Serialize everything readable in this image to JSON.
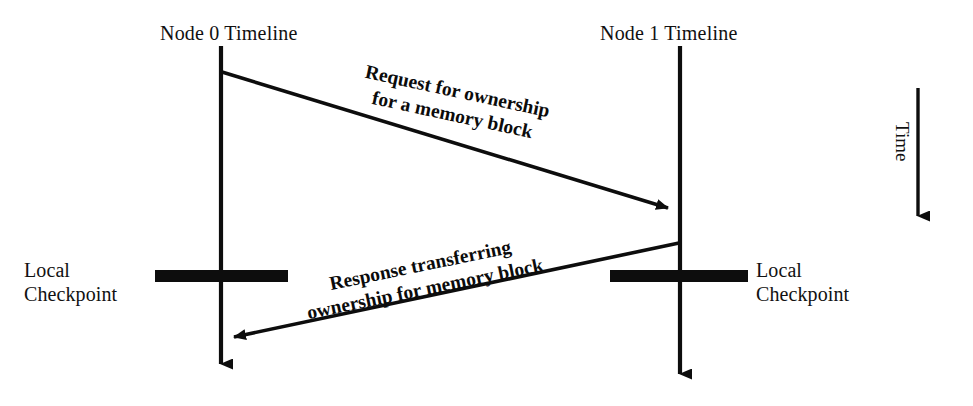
{
  "diagram": {
    "title_node0": "Node 0 Timeline",
    "title_node1": "Node 1 Timeline",
    "time_axis_label": "Time",
    "checkpoint_left": {
      "line1": "Local",
      "line2": "Checkpoint"
    },
    "checkpoint_right": {
      "line1": "Local",
      "line2": "Checkpoint"
    },
    "request_message": {
      "line1": "Request for ownership",
      "line2": "for a memory block"
    },
    "response_message": {
      "line1": "Response transferring",
      "line2": "ownership for memory block"
    },
    "colors": {
      "ink": "#0d0d0d",
      "background": "#ffffff"
    },
    "geometry": {
      "node0_x": 221,
      "node1_x": 680,
      "timeline_top": 46,
      "node0_timeline_bottom": 378,
      "node1_timeline_bottom": 388,
      "request_start_y": 72,
      "request_end_y": 212,
      "response_start_y": 243,
      "response_end_y": 340,
      "checkpoint_y": 276,
      "checkpoint_left_x1": 155,
      "checkpoint_left_x2": 288,
      "checkpoint_right_x1": 610,
      "checkpoint_right_x2": 748,
      "time_arrow_x": 918,
      "time_arrow_top": 88,
      "time_arrow_bottom": 230
    }
  }
}
